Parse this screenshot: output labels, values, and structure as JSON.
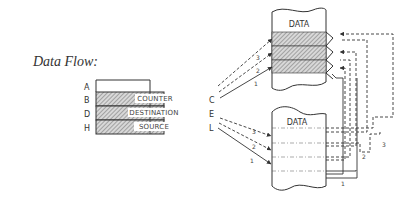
{
  "title": "Data Flow:",
  "registers": {
    "row_labels": [
      "A",
      "B",
      "D",
      "H"
    ],
    "right_labels": [
      "C",
      "E",
      "L"
    ],
    "names": [
      "COUNTER",
      "DESTINATION",
      "SOURCE"
    ]
  },
  "memory_top": {
    "label": "DATA",
    "arrow_numbers": [
      "3",
      "2",
      "1"
    ],
    "loop_numbers": [
      "3",
      "2",
      "1"
    ]
  },
  "memory_bottom": {
    "label": "DATA",
    "arrow_numbers": [
      "3",
      "2",
      "1"
    ]
  },
  "colors": {
    "line": "#3a3a3a",
    "hatch": "#9a9a9a"
  }
}
